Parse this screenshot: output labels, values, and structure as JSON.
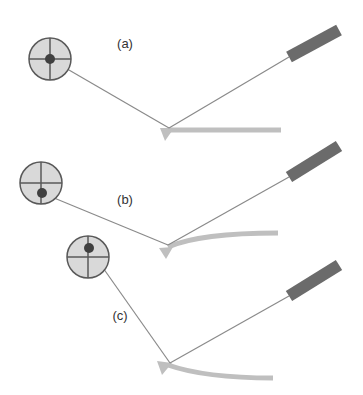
{
  "colors": {
    "circle_fill": "#d9d9d9",
    "circle_stroke": "#595959",
    "dot": "#404040",
    "string": "#8a8a8a",
    "bar": "#bfbfbf",
    "rect": "#6b6b6b",
    "label": "#333333"
  },
  "panels": [
    {
      "label": "(a)",
      "label_pos": [
        125,
        48
      ],
      "circle": {
        "cx": 50,
        "cy": 59,
        "r": 21,
        "dot": [
          50,
          59
        ]
      },
      "vertex": [
        169,
        128
      ],
      "rect": {
        "x1": 289,
        "y1": 57,
        "x2": 339,
        "y2": 30
      },
      "bar_path": "M 168 130 L 281 130",
      "triangle": "160,128 174,128 165,141"
    },
    {
      "label": "(b)",
      "label_pos": [
        125,
        204
      ],
      "circle": {
        "cx": 41,
        "cy": 183,
        "r": 21,
        "dot": [
          42,
          193
        ]
      },
      "vertex": [
        168,
        245
      ],
      "rect": {
        "x1": 289,
        "y1": 177,
        "x2": 339,
        "y2": 146
      },
      "bar_path": "M 168 247 Q 200 233 278 233",
      "triangle": "159,248 173,247 166,259"
    },
    {
      "label": "(c)",
      "label_pos": [
        120,
        320
      ],
      "circle": {
        "cx": 88,
        "cy": 257,
        "r": 21,
        "dot": [
          89,
          248
        ]
      },
      "vertex": [
        170,
        363
      ],
      "rect": {
        "x1": 289,
        "y1": 296,
        "x2": 339,
        "y2": 265
      },
      "bar_path": "M 168 365 Q 205 378 273 378",
      "triangle": "157,361 172,363 162,375"
    }
  ]
}
